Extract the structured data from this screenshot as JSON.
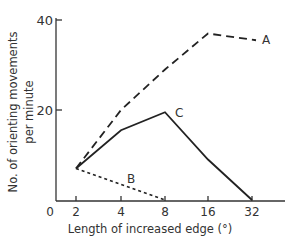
{
  "chart_data": {
    "type": "line",
    "title": "",
    "xlabel": "Length of increased edge (°)",
    "ylabel": "No. of orienting movements per minute",
    "ylabel_line1": "No. of orienting movements",
    "ylabel_line2": "per minute",
    "x_scale": "log2",
    "x_ticks": [
      "0",
      "2",
      "4",
      "8",
      "16",
      "32"
    ],
    "y_ticks": [
      "20",
      "40"
    ],
    "ylim": [
      0,
      40
    ],
    "grid": false,
    "legend": "inline line labels",
    "series": [
      {
        "name": "A",
        "style": "long-dashed",
        "x": [
          2,
          4,
          8,
          16,
          32
        ],
        "values": [
          7,
          20,
          29,
          37,
          35.5
        ]
      },
      {
        "name": "B",
        "style": "short-dashed",
        "x": [
          2,
          8
        ],
        "values": [
          7,
          0
        ]
      },
      {
        "name": "C",
        "style": "solid",
        "x": [
          2,
          4,
          8,
          16,
          32
        ],
        "values": [
          7,
          15.5,
          19.5,
          9,
          0
        ]
      }
    ]
  }
}
